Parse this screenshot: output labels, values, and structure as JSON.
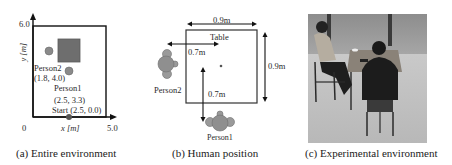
{
  "panels": {
    "a": {
      "caption": "(a) Entire environment",
      "y_axis_max": "6.0",
      "y_axis_label": "y [m]",
      "x_axis_origin": "0",
      "x_axis_max": "5.0",
      "x_axis_label": "x [m]",
      "person2_label": "Person2",
      "person2_coords": "(1.8, 4.0)",
      "person1_label": "Person1",
      "person1_coords": "(2.5, 3.3)",
      "start_label": "Start (2.5, 0.0)",
      "colors": {
        "table": "#6e6e6e",
        "person": "#8a8a8a",
        "start": "#555555",
        "frame": "#111111"
      }
    },
    "b": {
      "caption": "(b) Human position",
      "table_label": "Table",
      "table_width": "0.9m",
      "table_depth": "0.9m",
      "person2_distance": "0.7m",
      "person1_distance": "0.7m",
      "person2_label": "Person2",
      "person1_label": "Person1",
      "colors": {
        "person": "#8f8f8f",
        "frame": "#333333"
      }
    },
    "c": {
      "caption": "(c) Experimental environment",
      "photo_description": "Two people seated at a table in a room, viewed from above"
    }
  }
}
